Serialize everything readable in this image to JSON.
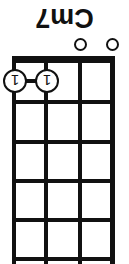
{
  "diagram": {
    "kind": "chord-diagram",
    "instrument_strings": 4,
    "fret_count": 5,
    "orientation": "rotated-180",
    "colors": {
      "ink": "#111111",
      "paper": "#ffffff"
    },
    "chord_name": "Cm7",
    "nut": {
      "label": "nut",
      "visible": true
    },
    "strings": [
      {
        "index": 1,
        "x": 16,
        "width": 5
      },
      {
        "index": 2,
        "x": 48,
        "width": 4
      },
      {
        "index": 3,
        "x": 82,
        "width": 4
      },
      {
        "index": 4,
        "x": 114,
        "width": 4
      }
    ],
    "frets": [
      {
        "index": 0,
        "y": 4
      },
      {
        "index": 1,
        "y": 42
      },
      {
        "index": 2,
        "y": 81
      },
      {
        "index": 3,
        "y": 120
      },
      {
        "index": 4,
        "y": 160
      },
      {
        "index": 5,
        "y": 200
      }
    ],
    "finger_dots": [
      {
        "string": 3,
        "fret": 1,
        "finger": "1",
        "cx": 82,
        "cy": 183
      },
      {
        "string": 4,
        "fret": 1,
        "finger": "1",
        "cx": 114,
        "cy": 183
      }
    ],
    "barre": {
      "present": true,
      "finger": "1",
      "from_string": 3,
      "to_string": 4,
      "fret": 1
    },
    "open_strings": [
      {
        "string": 1,
        "marker": "open-circle",
        "cx": 16,
        "cy": 219
      },
      {
        "string": 2,
        "marker": "open-circle",
        "cx": 48,
        "cy": 219
      }
    ]
  }
}
